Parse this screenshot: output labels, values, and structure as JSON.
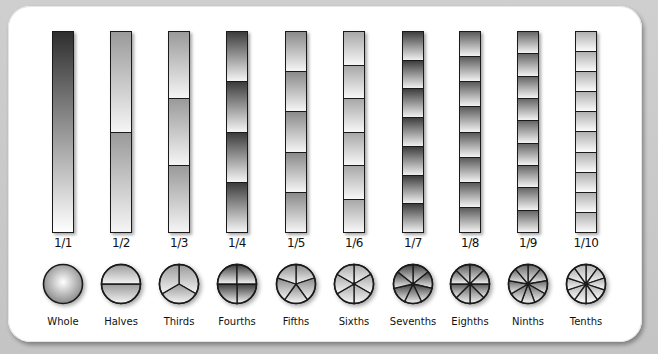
{
  "colors": {
    "frame": "#c4c4c4",
    "card": "#ffffff",
    "outline": "#1a1a1a",
    "dark_shade": "#3a3a3a",
    "mid_shade": "#9a9a9a",
    "light_shade": "#f4f4f4"
  },
  "fractions": [
    {
      "denominator": 1,
      "label": "1/1",
      "name": "Whole",
      "x": 63,
      "dark": "#2e2e2e",
      "light": "#ffffff"
    },
    {
      "denominator": 2,
      "label": "1/2",
      "name": "Halves",
      "x": 121,
      "dark": "#9a9a9a",
      "light": "#f5f5f5"
    },
    {
      "denominator": 3,
      "label": "1/3",
      "name": "Thirds",
      "x": 179,
      "dark": "#9a9a9a",
      "light": "#f5f5f5"
    },
    {
      "denominator": 4,
      "label": "1/4",
      "name": "Fourths",
      "x": 237,
      "dark": "#3c3c3c",
      "light": "#f5f5f5"
    },
    {
      "denominator": 5,
      "label": "1/5",
      "name": "Fifths",
      "x": 296,
      "dark": "#8a8a8a",
      "light": "#f5f5f5"
    },
    {
      "denominator": 6,
      "label": "1/6",
      "name": "Sixths",
      "x": 354,
      "dark": "#a8a8a8",
      "light": "#f7f7f7"
    },
    {
      "denominator": 7,
      "label": "1/7",
      "name": "Sevenths",
      "x": 413,
      "dark": "#3e3e3e",
      "light": "#f0f0f0"
    },
    {
      "denominator": 8,
      "label": "1/8",
      "name": "Eighths",
      "x": 470,
      "dark": "#5a5a5a",
      "light": "#f3f3f3"
    },
    {
      "denominator": 9,
      "label": "1/9",
      "name": "Ninths",
      "x": 528,
      "dark": "#666666",
      "light": "#f3f3f3"
    },
    {
      "denominator": 10,
      "label": "1/10",
      "name": "Tenths",
      "x": 586,
      "dark": "#b0b0b0",
      "light": "#fafafa"
    }
  ]
}
